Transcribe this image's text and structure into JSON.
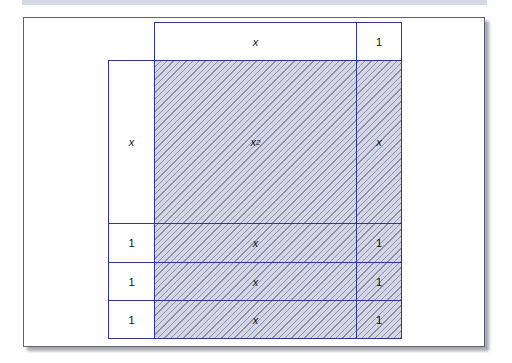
{
  "diagram": {
    "type": "algebra-tile area model",
    "expression": "(x + 1)(x + 3) = x^2 + 4x + 3",
    "top_labels": [
      "x",
      "1"
    ],
    "left_labels": [
      "x",
      "1",
      "1",
      "1"
    ],
    "tiles": {
      "x_squared": {
        "label": "x",
        "sup": "2"
      },
      "x_right": "x",
      "row_x": [
        "x",
        "x",
        "x"
      ],
      "row_1": [
        "1",
        "1",
        "1"
      ]
    },
    "colors": {
      "border": "#2f3595",
      "fill": "#d3d6e6",
      "hatch": "#8e91a6"
    }
  }
}
